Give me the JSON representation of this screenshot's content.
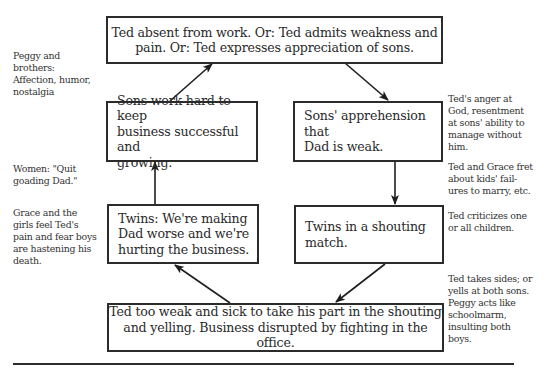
{
  "diagram": {
    "type": "cycle-flowchart",
    "nodes": [
      {
        "id": "top",
        "text": "Ted absent from work. Or: Ted admits weakness and pain. Or: Ted expresses appreciation of sons."
      },
      {
        "id": "left_upper",
        "text": "Sons work hard to keep business successful and growing."
      },
      {
        "id": "right_upper",
        "text": "Sons' apprehension that Dad is weak."
      },
      {
        "id": "left_lower",
        "text": "Twins: We're making Dad worse and we're hurting the business."
      },
      {
        "id": "right_lower",
        "text": "Twins in a shouting match."
      },
      {
        "id": "bottom",
        "text": "Ted too weak and sick to take his part in the shouting and yelling. Business disrupted by fighting in the office."
      }
    ],
    "edges": [
      {
        "from": "top",
        "to": "right_upper"
      },
      {
        "from": "right_upper",
        "to": "right_lower"
      },
      {
        "from": "right_lower",
        "to": "bottom"
      },
      {
        "from": "bottom",
        "to": "left_lower"
      },
      {
        "from": "left_lower",
        "to": "left_upper"
      },
      {
        "from": "left_upper",
        "to": "top"
      }
    ],
    "annotations": {
      "left_1": "Peggy and brothers: Affection, humor, nostalgia",
      "left_2": "Women: \"Quit goading Dad.\"",
      "left_3": "Grace and the girls feel Ted's pain and fear boys are hastening his death.",
      "right_1": "Ted's anger at God, resentment at sons' ability to manage without him.",
      "right_2": "Ted and Grace fret about kids' failures to marry, etc.",
      "right_3": "Ted criticizes one or all children.",
      "right_4": "Ted takes sides; or yells at both sons. Peggy acts like schoolmarm, insulting both boys."
    }
  },
  "boxes": {
    "top": {
      "line1": "Ted absent from work. Or: Ted admits weakness and",
      "line2": "pain. Or: Ted expresses appreciation of sons."
    },
    "left_upper": {
      "line1": "Sons work hard to keep",
      "line2": "business successful and",
      "line3": "growing."
    },
    "right_upper": {
      "line1": "Sons' apprehension that",
      "line2": "Dad is weak."
    },
    "left_lower": {
      "line1": "Twins: We're making",
      "line2": "Dad worse and we're",
      "line3": "hurting the business."
    },
    "right_lower": {
      "line1": "Twins in a shouting",
      "line2": "match."
    },
    "bottom": {
      "line1": "Ted too weak and sick to take his part in the shouting",
      "line2": "and yelling. Business disrupted by fighting in the office."
    }
  },
  "notes": {
    "left_1": {
      "l1": "Peggy and",
      "l2": "brothers:",
      "l3": "Affection, humor,",
      "l4": "nostalgia"
    },
    "left_2": {
      "l1": "Women: \"Quit",
      "l2": "goading Dad.\""
    },
    "left_3": {
      "l1": "Grace and the",
      "l2": "girls feel Ted's",
      "l3": "pain and fear boys",
      "l4": "are hastening his",
      "l5": "death."
    },
    "right_1": {
      "l1": "Ted's anger at",
      "l2": "God, resentment",
      "l3": "at sons' ability to",
      "l4": "manage without",
      "l5": "him."
    },
    "right_2": {
      "l1": "Ted and Grace fret",
      "l2": "about kids' fail-",
      "l3": "ures to marry, etc."
    },
    "right_3": {
      "l1": "Ted criticizes one",
      "l2": "or all children."
    },
    "right_4": {
      "l1": "Ted takes sides; or",
      "l2": "yells at both sons.",
      "l3": "Peggy acts like",
      "l4": "schoolmarm,",
      "l5": "insulting both",
      "l6": "boys."
    }
  },
  "colors": {
    "ink": "#2b2b2b",
    "text": "#2a2a2a",
    "background": "#ffffff"
  }
}
